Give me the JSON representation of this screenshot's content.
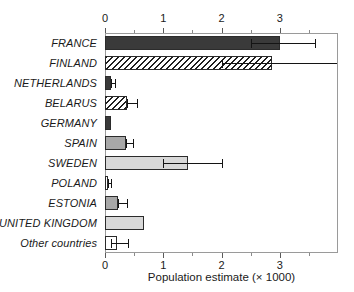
{
  "chart_data": {
    "type": "bar",
    "orientation": "horizontal",
    "title": "",
    "xlabel": "Population estimate (× 1000)",
    "ylabel": "",
    "xlim": [
      0,
      4.0
    ],
    "xticks": [
      0,
      1,
      2,
      3
    ],
    "xticklabels": [
      "0",
      "1",
      "2",
      "3"
    ],
    "minor_xticks": [
      0.5,
      1.5,
      2.5,
      3.5
    ],
    "grid": false,
    "legend": null,
    "axis_positions": [
      "top",
      "bottom"
    ],
    "categories": [
      "FRANCE",
      "FINLAND",
      "NETHERLANDS",
      "BELARUS",
      "GERMANY",
      "SPAIN",
      "SWEDEN",
      "POLAND",
      "ESTONIA",
      "UNITED KINGDOM",
      "Other countries"
    ],
    "values": [
      3.0,
      2.87,
      0.1,
      0.38,
      0.1,
      0.36,
      1.42,
      0.05,
      0.22,
      0.67,
      0.21
    ],
    "error_low": [
      2.5,
      2.0,
      0.1,
      0.38,
      null,
      0.36,
      1.0,
      0.05,
      0.22,
      null,
      0.1
    ],
    "error_high": [
      3.6,
      4.0,
      0.17,
      0.55,
      null,
      0.48,
      2.0,
      0.1,
      0.38,
      null,
      0.4
    ],
    "fills": [
      "dark",
      "hatch",
      "dark",
      "hatch",
      "dark",
      "mid",
      "light",
      "white",
      "mid",
      "light",
      "white"
    ],
    "colors": {
      "dark": "#3a3a3a",
      "mid": "#a8a8a8",
      "light": "#d8d8d8",
      "white": "#ffffff",
      "hatch": "#ffffff",
      "bar_edge": "#2b2b2b",
      "error_bar": "#141414",
      "axis": "#9a9a9a",
      "text": "#1a1a1a"
    }
  }
}
